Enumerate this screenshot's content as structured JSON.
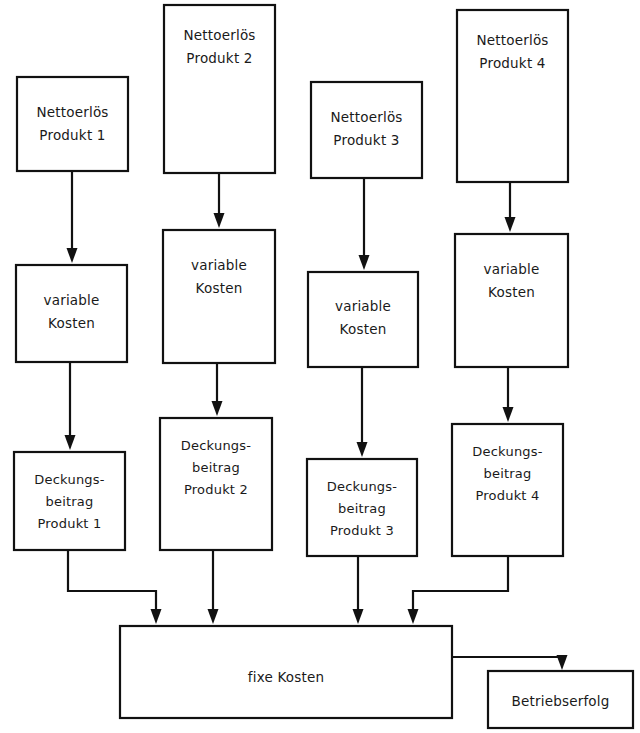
{
  "diagram": {
    "language": "de",
    "background_color": "#ffffff",
    "line_color": "#111111",
    "text_color": "#1a1a1a",
    "nodes": [
      {
        "id": "nettoerloes-1",
        "lines": [
          "Nettoerlös",
          "Produkt 1"
        ],
        "line1": "Nettoerlös",
        "line2": "Produkt 1",
        "line3": "",
        "x": 17,
        "y": 77,
        "w": 111,
        "h": 94,
        "text_y": 112
      },
      {
        "id": "nettoerloes-2",
        "lines": [
          "Nettoerlös",
          "Produkt 2"
        ],
        "line1": "Nettoerlös",
        "line2": "Produkt 2",
        "line3": "",
        "x": 164,
        "y": 5,
        "w": 111,
        "h": 168,
        "text_y": 40
      },
      {
        "id": "nettoerloes-3",
        "lines": [
          "Nettoerlös",
          "Produkt 3"
        ],
        "line1": "Nettoerlös",
        "line2": "Produkt 3",
        "line3": "",
        "x": 311,
        "y": 82,
        "w": 111,
        "h": 96,
        "text_y": 117
      },
      {
        "id": "nettoerloes-4",
        "lines": [
          "Nettoerlös",
          "Produkt 4"
        ],
        "line1": "Nettoerlös",
        "line2": "Produkt 4",
        "line3": "",
        "x": 457,
        "y": 10,
        "w": 111,
        "h": 172,
        "text_y": 45
      },
      {
        "id": "variable-kosten-1",
        "lines": [
          "variable",
          "Kosten"
        ],
        "line1": "variable",
        "line2": "Kosten",
        "line3": "",
        "x": 16,
        "y": 265,
        "w": 111,
        "h": 97,
        "text_y": 303
      },
      {
        "id": "variable-kosten-2",
        "lines": [
          "variable",
          "Kosten"
        ],
        "line1": "variable",
        "line2": "Kosten",
        "line3": "",
        "x": 163,
        "y": 230,
        "w": 112,
        "h": 133,
        "text_y": 268
      },
      {
        "id": "variable-kosten-3",
        "lines": [
          "variable",
          "Kosten"
        ],
        "line1": "variable",
        "line2": "Kosten",
        "line3": "",
        "x": 308,
        "y": 272,
        "w": 110,
        "h": 95,
        "text_y": 310
      },
      {
        "id": "variable-kosten-4",
        "lines": [
          "variable",
          "Kosten"
        ],
        "line1": "variable",
        "line2": "Kosten",
        "line3": "",
        "x": 455,
        "y": 234,
        "w": 113,
        "h": 133,
        "text_y": 272
      },
      {
        "id": "deckungsbeitrag-1",
        "lines": [
          "Deckungs-",
          "beitrag",
          "Produkt 1"
        ],
        "line1": "Deckungs-",
        "line2": "beitrag",
        "line3": "Produkt 1",
        "x": 14,
        "y": 452,
        "w": 111,
        "h": 98,
        "text_y": 483
      },
      {
        "id": "deckungsbeitrag-2",
        "lines": [
          "Deckungs-",
          "beitrag",
          "Produkt 2"
        ],
        "line1": "Deckungs-",
        "line2": "beitrag",
        "line3": "Produkt 2",
        "x": 160,
        "y": 418,
        "w": 112,
        "h": 132,
        "text_y": 449
      },
      {
        "id": "deckungsbeitrag-3",
        "lines": [
          "Deckungs-",
          "beitrag",
          "Produkt 3"
        ],
        "line1": "Deckungs-",
        "line2": "beitrag",
        "line3": "Produkt 3",
        "x": 307,
        "y": 459,
        "w": 110,
        "h": 97,
        "text_y": 490
      },
      {
        "id": "deckungsbeitrag-4",
        "lines": [
          "Deckungs-",
          "beitrag",
          "Produkt 4"
        ],
        "line1": "Deckungs-",
        "line2": "beitrag",
        "line3": "Produkt 4",
        "x": 452,
        "y": 424,
        "w": 111,
        "h": 132,
        "text_y": 455
      },
      {
        "id": "fixe-kosten",
        "lines": [
          "fixe Kosten"
        ],
        "line1": "fixe Kosten",
        "line2": "",
        "line3": "",
        "x": 120,
        "y": 626,
        "w": 332,
        "h": 92,
        "text_y": 680
      },
      {
        "id": "betriebserfolg",
        "lines": [
          "Betriebserfolg"
        ],
        "line1": "Betriebserfolg",
        "line2": "",
        "line3": "",
        "x": 488,
        "y": 671,
        "w": 145,
        "h": 57,
        "text_y": 704
      }
    ],
    "connectors": [
      {
        "id": "c1",
        "from": "nettoerloes-1",
        "to": "variable-kosten-1",
        "type": "straight"
      },
      {
        "id": "c2",
        "from": "nettoerloes-2",
        "to": "variable-kosten-2",
        "type": "straight"
      },
      {
        "id": "c3",
        "from": "nettoerloes-3",
        "to": "variable-kosten-3",
        "type": "straight"
      },
      {
        "id": "c4",
        "from": "nettoerloes-4",
        "to": "variable-kosten-4",
        "type": "straight"
      },
      {
        "id": "c5",
        "from": "variable-kosten-1",
        "to": "deckungsbeitrag-1",
        "type": "straight"
      },
      {
        "id": "c6",
        "from": "variable-kosten-2",
        "to": "deckungsbeitrag-2",
        "type": "straight"
      },
      {
        "id": "c7",
        "from": "variable-kosten-3",
        "to": "deckungsbeitrag-3",
        "type": "straight"
      },
      {
        "id": "c8",
        "from": "variable-kosten-4",
        "to": "deckungsbeitrag-4",
        "type": "straight"
      },
      {
        "id": "c9",
        "from": "deckungsbeitrag-1",
        "to": "fixe-kosten",
        "type": "elbow-right"
      },
      {
        "id": "c10",
        "from": "deckungsbeitrag-2",
        "to": "fixe-kosten",
        "type": "straight"
      },
      {
        "id": "c11",
        "from": "deckungsbeitrag-3",
        "to": "fixe-kosten",
        "type": "straight"
      },
      {
        "id": "c12",
        "from": "deckungsbeitrag-4",
        "to": "fixe-kosten",
        "type": "elbow-left"
      },
      {
        "id": "c13",
        "from": "fixe-kosten",
        "to": "betriebserfolg",
        "type": "elbow-right"
      }
    ]
  }
}
